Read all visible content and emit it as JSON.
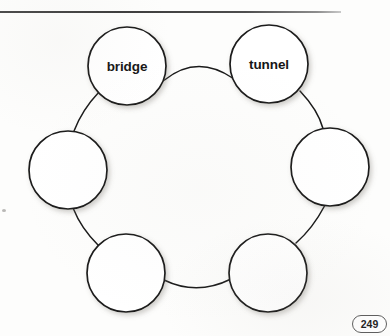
{
  "page": {
    "number_label": "249",
    "width": 390,
    "height": 336
  },
  "divider": {
    "name": "top-horizontal-rule"
  },
  "diagram": {
    "type": "circle-map",
    "shape": "hexagonal-ring",
    "node_count": 6,
    "node_diameter": 78,
    "ring_center": {
      "x": 193,
      "y": 180
    },
    "nodes": [
      {
        "id": "node-top-left",
        "label": "bridge",
        "filled": true,
        "cx": 127,
        "cy": 66,
        "r": 39
      },
      {
        "id": "node-top-right",
        "label": "tunnel",
        "filled": true,
        "cx": 269,
        "cy": 64,
        "r": 39
      },
      {
        "id": "node-right",
        "label": "",
        "filled": false,
        "cx": 330,
        "cy": 167,
        "r": 39
      },
      {
        "id": "node-bottom-right",
        "label": "",
        "filled": false,
        "cx": 268,
        "cy": 273,
        "r": 39
      },
      {
        "id": "node-bottom-left",
        "label": "",
        "filled": false,
        "cx": 126,
        "cy": 273,
        "r": 39
      },
      {
        "id": "node-left",
        "label": "",
        "filled": false,
        "cx": 68,
        "cy": 170,
        "r": 39
      }
    ],
    "connectors": [
      {
        "id": "connector-top",
        "from": "node-top-left",
        "to": "node-top-right"
      },
      {
        "id": "connector-upper-right",
        "from": "node-top-right",
        "to": "node-right"
      },
      {
        "id": "connector-lower-right",
        "from": "node-right",
        "to": "node-bottom-right"
      },
      {
        "id": "connector-bottom",
        "from": "node-bottom-right",
        "to": "node-bottom-left"
      },
      {
        "id": "connector-lower-left",
        "from": "node-bottom-left",
        "to": "node-left"
      },
      {
        "id": "connector-upper-left",
        "from": "node-left",
        "to": "node-top-left"
      }
    ],
    "stroke_color": "#1a1a1a",
    "fill_color": "#ffffff"
  }
}
